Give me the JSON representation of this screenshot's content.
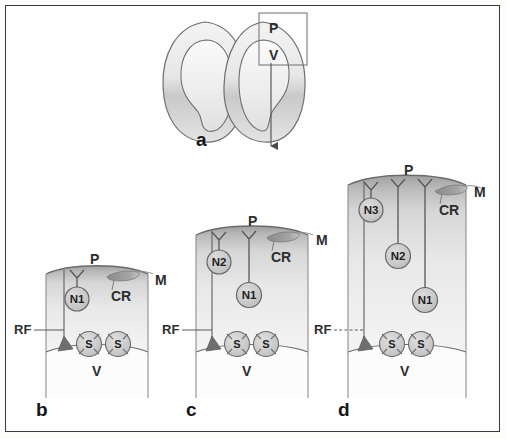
{
  "figure": {
    "caption_letters": [
      "a",
      "b",
      "c",
      "d"
    ],
    "background_color": "#fefefe",
    "frame_color": "#3a3a3a",
    "tissue_color": "#cfcfcf",
    "outline_color": "#5a5a5a",
    "cell_fill": "#c9c9c9",
    "cilium_color": "#8c8c8c"
  },
  "panel_a": {
    "letter": "a",
    "labels": {
      "pial": "P",
      "ventricle": "V"
    },
    "has_inset_rectangle": true,
    "has_arrow": true,
    "lobes": 2
  },
  "panel_b": {
    "letter": "b",
    "labels": {
      "pial": "P",
      "marginal": "M",
      "cilium": "CR",
      "radial_fiber": "RF",
      "ventricle": "V"
    },
    "neurons": [
      "N1"
    ],
    "stem_cells": [
      "S",
      "S"
    ],
    "receptors": 1
  },
  "panel_c": {
    "letter": "c",
    "labels": {
      "pial": "P",
      "marginal": "M",
      "cilium": "CR",
      "radial_fiber": "RF",
      "ventricle": "V"
    },
    "neurons": [
      "N2",
      "N1"
    ],
    "stem_cells": [
      "S",
      "S"
    ],
    "receptors": 2
  },
  "panel_d": {
    "letter": "d",
    "labels": {
      "pial": "P",
      "marginal": "M",
      "cilium": "CR",
      "radial_fiber": "RF",
      "ventricle": "V"
    },
    "neurons": [
      "N3",
      "N2",
      "N1"
    ],
    "stem_cells": [
      "S",
      "S"
    ],
    "receptors": 3
  }
}
